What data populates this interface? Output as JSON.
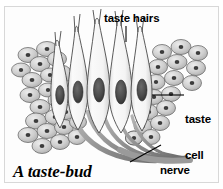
{
  "figure": {
    "caption": "A taste-bud",
    "border_color": "#d8d8d8",
    "background_color": "#ffffff"
  },
  "labels": {
    "taste_hairs": "taste hairs",
    "taste_cell_line1": "taste",
    "taste_cell_line2": "cell",
    "nerve_fibres_line1": "nerve",
    "nerve_fibres_line2": "fibres"
  },
  "diagram": {
    "title": "A taste-bud",
    "type": "biological-cross-section",
    "structures": [
      {
        "name": "taste hairs",
        "description": "fine pointed projections at the apex of the taste cells"
      },
      {
        "name": "taste cell",
        "description": "elongated spindle-shaped receptor cell with a large dark oval nucleus"
      },
      {
        "name": "nerve fibres",
        "description": "bundled fibres converging below the bud and exiting to the lower right"
      },
      {
        "name": "epithelial cells",
        "description": "oval supporting cells with small dark nuclei flanking both sides of the bud"
      }
    ],
    "colors": {
      "outline": "#3a3a3a",
      "cell_fill": "#f2f2f2",
      "epithelium_fill": "#c9c9c9",
      "nucleus": "#4a4a4a",
      "nerve": "#8c8c8c"
    }
  }
}
